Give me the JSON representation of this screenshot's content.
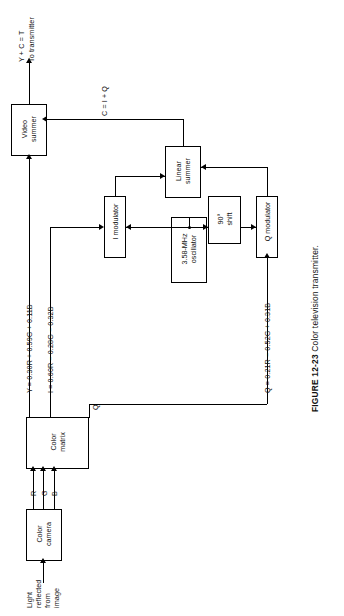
{
  "figure": {
    "number": "FIGURE 12-23",
    "title": "Color television transmitter."
  },
  "boxes": {
    "color_camera": "Color\ncamera",
    "color_camera_l1": "Color",
    "color_camera_l2": "camera",
    "color_matrix_l1": "Color",
    "color_matrix_l2": "matrix",
    "video_summer_l1": "Video",
    "video_summer_l2": "summer",
    "i_modulator": "I modulator",
    "q_modulator": "Q modulator",
    "linear_summer_l1": "Linear",
    "linear_summer_l2": "summer",
    "oscillator_l1": "3.58-MHz",
    "oscillator_l2": "oscillator",
    "shift_l1": "90°",
    "shift_l2": "shift"
  },
  "labels": {
    "input_l1": "Light",
    "input_l2": "reflected",
    "input_l3": "from",
    "input_l4": "image",
    "rgb_r": "R",
    "rgb_g": "G",
    "rgb_b": "B",
    "y_equation": "Y = 0.30R + 0.59G + 0.11B",
    "i_equation": "I = 0.60R − 0.28G − 0.32B",
    "q_equation": "Q = 0.21R − 0.52G + 0.31B",
    "q_tap": "Q",
    "c_sum": "C = I + Q",
    "output_l1": "Y + C = T",
    "output_l2": "To transmitter"
  }
}
